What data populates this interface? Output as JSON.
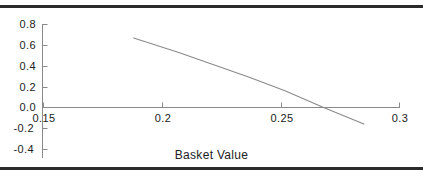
{
  "figure": {
    "background_color": "#ffffff",
    "rule_color": "#2b2b2b",
    "axis_color": "#8a8a8a",
    "series_color": "#8a8a8a",
    "text_color": "#222222"
  },
  "chart_data": {
    "type": "line",
    "title": "",
    "subtitle": "",
    "xlabel": "Basket Value",
    "ylabel": "",
    "xlim": [
      0.15,
      0.3
    ],
    "ylim": [
      -0.4,
      0.8
    ],
    "grid": false,
    "legend": null,
    "xticks": [
      0.15,
      0.2,
      0.25,
      0.3
    ],
    "xticklabels": [
      "0.15",
      "0.2",
      "0.25",
      "0.3"
    ],
    "yticks": [
      -0.4,
      -0.2,
      0.0,
      0.2,
      0.4,
      0.6,
      0.8
    ],
    "yticklabels": [
      "-0.4",
      "-0.2",
      "0.0",
      "0.2",
      "0.4",
      "0.6",
      "0.8"
    ],
    "series": [
      {
        "name": "series-1",
        "color": "#8a8a8a",
        "x": [
          0.188,
          0.207,
          0.222,
          0.237,
          0.252,
          0.268,
          0.285
        ],
        "y": [
          0.67,
          0.53,
          0.41,
          0.29,
          0.16,
          0.0,
          -0.16
        ]
      }
    ],
    "annotations": [],
    "zero_crossing_x": 0.268
  },
  "axis_titles": {
    "x": "Basket Value"
  }
}
